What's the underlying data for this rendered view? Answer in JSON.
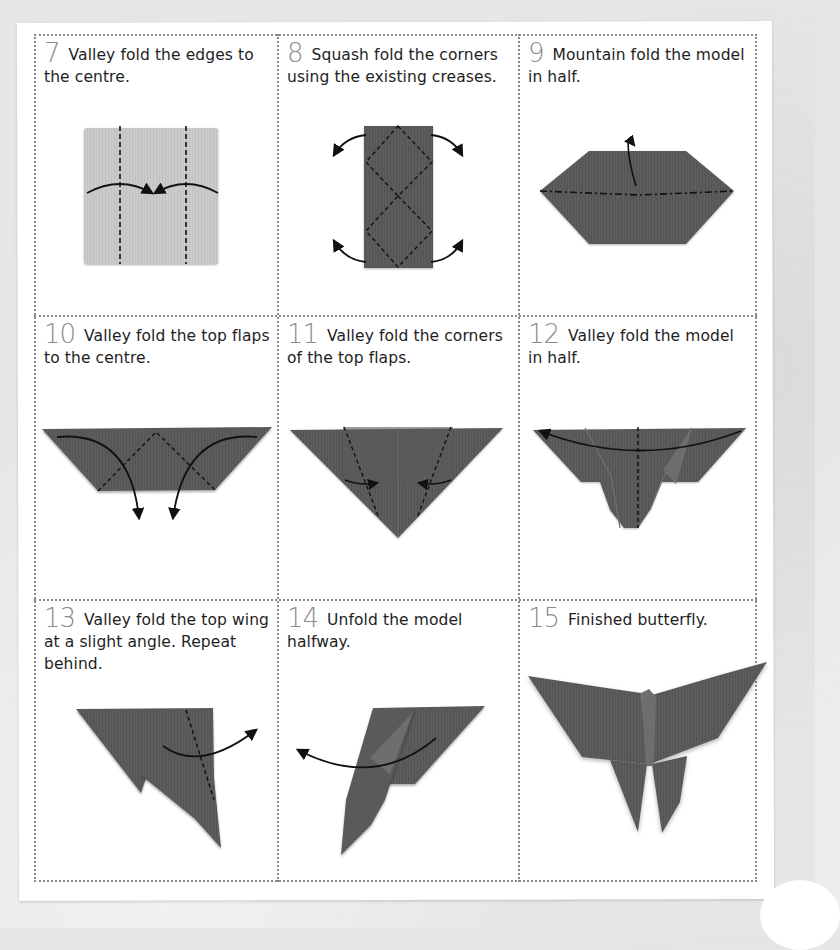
{
  "page": {
    "type": "origami instruction sheet",
    "colors": {
      "background": "#e6e6e6",
      "sheet": "#ffffff",
      "border_dots": "#8a8a8a",
      "step_number": "#8c8c8c",
      "caption_text": "#1e1e1e",
      "light_paper": "#c9c9c9",
      "dark_paper": "#5c5c5c",
      "crease_line": "#111111"
    }
  },
  "steps": [
    {
      "number": "7",
      "text": "Valley fold the edges to the centre.",
      "illustration": "square-with-two-valley-creases-arrows-to-centre"
    },
    {
      "number": "8",
      "text": "Squash fold the corners using the existing creases.",
      "illustration": "tall-rectangle-with-diamond-creases-four-curved-arrows"
    },
    {
      "number": "9",
      "text": "Mountain fold the model in half.",
      "illustration": "hexagon-with-mountain-fold-line-and-hook-arrow"
    },
    {
      "number": "10",
      "text": "Valley fold the top flaps to the centre.",
      "illustration": "trapezoid-with-triangle-creases-two-down-arrows"
    },
    {
      "number": "11",
      "text": "Valley fold the corners of the top flaps.",
      "illustration": "inverted-triangle-with-two-crease-lines-inward-arrows"
    },
    {
      "number": "12",
      "text": "Valley fold the model in half.",
      "illustration": "folded-shape-with-centre-crease-and-sweeping-arrow"
    },
    {
      "number": "13",
      "text": "Valley fold the top wing at a slight angle. Repeat behind.",
      "illustration": "half-model-with-angled-crease-and-arrow-right"
    },
    {
      "number": "14",
      "text": "Unfold the model halfway.",
      "illustration": "half-model-opening-with-arrow-left"
    },
    {
      "number": "15",
      "text": "Finished butterfly.",
      "illustration": "finished-origami-butterfly"
    }
  ]
}
